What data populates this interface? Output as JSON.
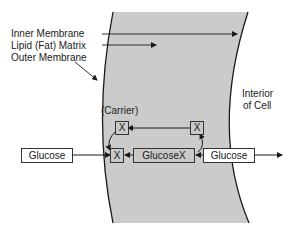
{
  "labels": {
    "inner_membrane": "Inner Membrane",
    "lipid_matrix": "Lipid (Fat) Matrix",
    "outer_membrane": "Outer Membrane",
    "interior_line1": "Interior",
    "interior_line2": "of Cell",
    "carrier": "(Carrier)"
  },
  "boxes": {
    "glucose_outside": "Glucose",
    "carrier_top_left": "X",
    "carrier_top_right": "X",
    "carrier_bottom": "X",
    "glucose_x": "GlucoseX",
    "glucose_inside": "Glucose"
  },
  "colors": {
    "membrane_fill": "#cbcbcb",
    "line": "#1a1a1a"
  }
}
